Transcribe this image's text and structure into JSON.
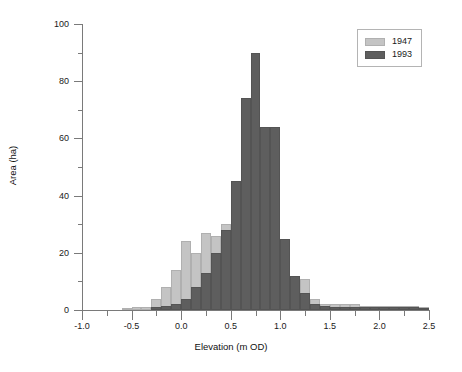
{
  "chart_data": {
    "type": "bar",
    "title": "",
    "xlabel": "Elevation (m OD)",
    "ylabel": "Area (ha)",
    "xlim": [
      -1.0,
      2.5
    ],
    "ylim": [
      0,
      100
    ],
    "grid": false,
    "legend_position": "top-right",
    "bin_width": 0.1,
    "x_ticks": [
      {
        "value": -1.0,
        "label": "-1.0"
      },
      {
        "value": -0.5,
        "label": "-0.5"
      },
      {
        "value": 0.0,
        "label": "0.0"
      },
      {
        "value": 0.5,
        "label": "0.5"
      },
      {
        "value": 1.0,
        "label": "1.0"
      },
      {
        "value": 1.5,
        "label": "1.5"
      },
      {
        "value": 2.0,
        "label": "2.0"
      },
      {
        "value": 2.5,
        "label": "2.5"
      }
    ],
    "x_minor_ticks": [
      -0.75,
      -0.25,
      0.25,
      0.75,
      1.25,
      1.75,
      2.25
    ],
    "y_ticks": [
      {
        "value": 0,
        "label": "0"
      },
      {
        "value": 20,
        "label": "20"
      },
      {
        "value": 40,
        "label": "40"
      },
      {
        "value": 60,
        "label": "60"
      },
      {
        "value": 80,
        "label": "80"
      },
      {
        "value": 100,
        "label": "100"
      }
    ],
    "y_minor_ticks": [
      10,
      30,
      50,
      70,
      90
    ],
    "bin_starts": [
      -1.0,
      -0.9,
      -0.8,
      -0.7,
      -0.6,
      -0.5,
      -0.4,
      -0.3,
      -0.2,
      -0.1,
      0.0,
      0.1,
      0.2,
      0.3,
      0.4,
      0.5,
      0.6,
      0.7,
      0.8,
      0.9,
      1.0,
      1.1,
      1.2,
      1.3,
      1.4,
      1.5,
      1.6,
      1.7,
      1.8,
      1.9,
      2.0,
      2.1,
      2.2,
      2.3,
      2.4
    ],
    "series": [
      {
        "name": "1947",
        "color": "#c4c4c4",
        "values": [
          0,
          0,
          0,
          0,
          0.5,
          1,
          1,
          4,
          8,
          14,
          24,
          20,
          27,
          26,
          30,
          30,
          30,
          30,
          25,
          26,
          14,
          10,
          11,
          4,
          2,
          2,
          2,
          2,
          1.5,
          1.5,
          1.5,
          1.5,
          1.5,
          1.5,
          1
        ]
      },
      {
        "name": "1993",
        "color": "#5e5e5e",
        "values": [
          0,
          0,
          0,
          0,
          0,
          0,
          0,
          1,
          1.5,
          2,
          4,
          8,
          13,
          20,
          28,
          45,
          74,
          90,
          64,
          64,
          25,
          12,
          6,
          2,
          1.5,
          1,
          1,
          1,
          1,
          1,
          1,
          1,
          1,
          1,
          0.5
        ]
      }
    ]
  },
  "legend": {
    "entries": [
      {
        "label": "1947"
      },
      {
        "label": "1993"
      }
    ]
  }
}
